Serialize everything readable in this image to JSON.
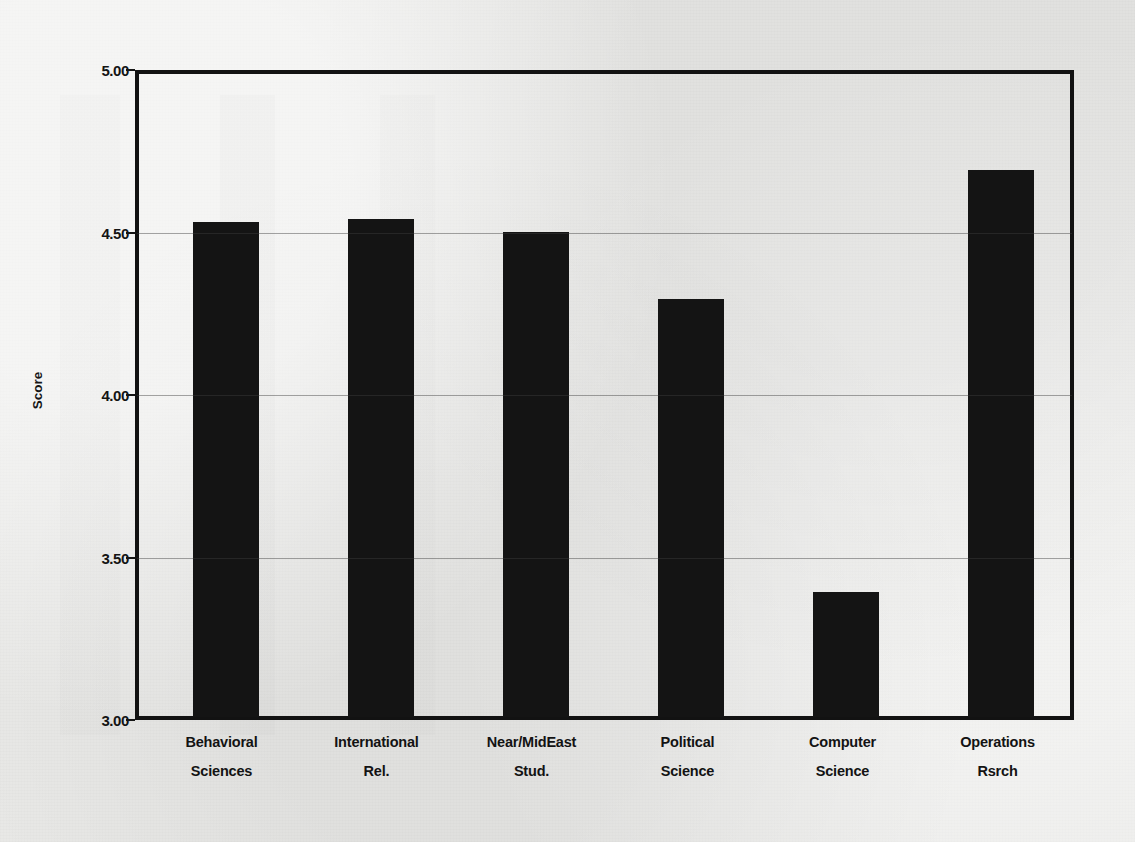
{
  "chart_data": {
    "type": "bar",
    "title": "",
    "subtitle": "",
    "xlabel": "",
    "ylabel": "Score",
    "ylim": [
      3.0,
      5.0
    ],
    "ytick_values": [
      3.0,
      3.5,
      4.0,
      4.5,
      5.0
    ],
    "ytick_labels": [
      "3.00",
      "3.50",
      "4.00",
      "4.50",
      "5.00"
    ],
    "grid": true,
    "grid_axis": "y",
    "legend": "none",
    "bar_color": "#141414",
    "background_color": "#e9e9e7",
    "axis_color": "#121212",
    "categories": [
      "Behavioral Sciences",
      "International Rel.",
      "Near/MidEast Stud.",
      "Political Science",
      "Computer Science",
      "Operations Rsrch"
    ],
    "category_lines": [
      [
        "Behavioral",
        "Sciences"
      ],
      [
        "International",
        "Rel."
      ],
      [
        "Near/MidEast",
        "Stud."
      ],
      [
        "Political",
        "Science"
      ],
      [
        "Computer",
        "Science"
      ],
      [
        "Operations",
        "Rsrch"
      ]
    ],
    "values": [
      4.54,
      4.55,
      4.51,
      4.3,
      3.39,
      4.7
    ]
  }
}
